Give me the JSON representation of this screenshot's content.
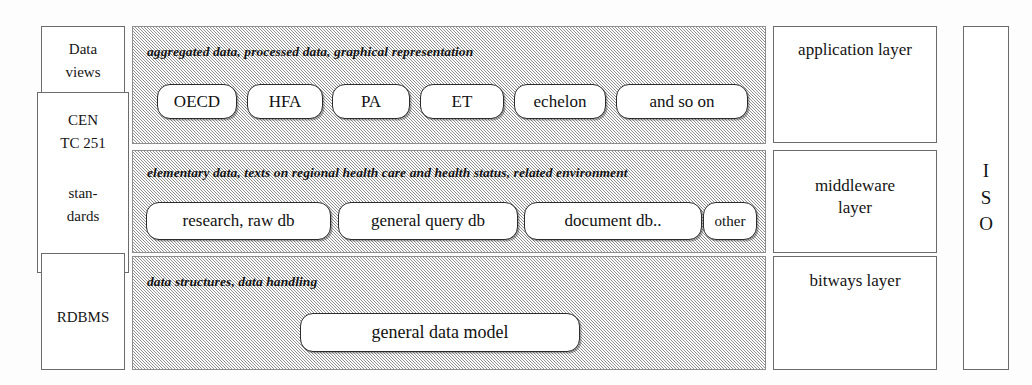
{
  "diagram": {
    "left_column": {
      "data_views": {
        "line1": "Data",
        "line2": "views"
      },
      "cen": {
        "line1": "CEN",
        "line2": "TC 251",
        "line3": "stan-",
        "line4": "dards"
      },
      "rdbms": {
        "label": "RDBMS"
      }
    },
    "panels": [
      {
        "id": "application",
        "caption": "aggregated data, processed data, graphical representation",
        "items": [
          {
            "label": "OECD"
          },
          {
            "label": "HFA"
          },
          {
            "label": "PA"
          },
          {
            "label": "ET"
          },
          {
            "label": "echelon"
          },
          {
            "label": "and so on"
          }
        ]
      },
      {
        "id": "middleware",
        "caption": "elementary data, texts on regional health care and health status, related environment",
        "items": [
          {
            "label": "research, raw db"
          },
          {
            "label": "general query db"
          },
          {
            "label": "document db.."
          },
          {
            "label": "other"
          }
        ]
      },
      {
        "id": "bitways",
        "caption": "data structures, data handling",
        "items": [
          {
            "label": "general data model"
          }
        ]
      }
    ],
    "layers": {
      "application": "application layer",
      "middleware_line1": "middleware",
      "middleware_line2": "layer",
      "bitways": "bitways layer"
    },
    "standards_column": {
      "letter1": "I",
      "letter2": "S",
      "letter3": "O"
    },
    "colors": {
      "panel_fill": "#d8d8d8",
      "box_border": "#2b2b2b",
      "frame_border": "#6b6b6b",
      "background": "#ffffff",
      "text": "#131313"
    }
  }
}
